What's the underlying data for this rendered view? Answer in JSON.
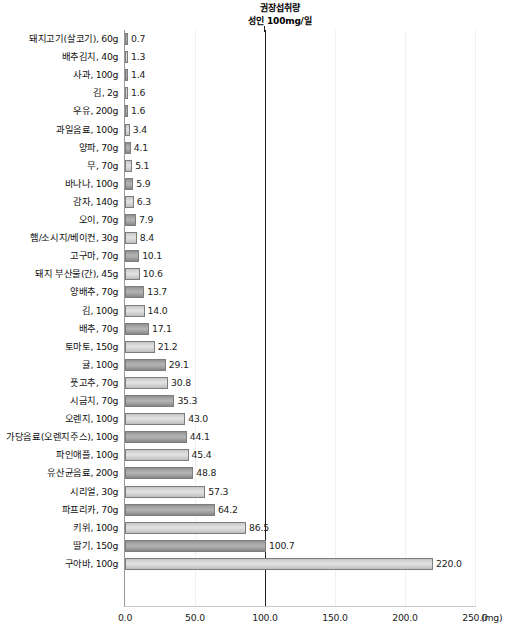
{
  "chart_data": {
    "type": "bar",
    "orientation": "horizontal",
    "title": "권장섭취량\n성인 100mg/일",
    "title_line1": "권장섭취량",
    "title_line2": "성인 100mg/일",
    "xlabel": "(mg)",
    "ylabel": "",
    "xlim": [
      0,
      250
    ],
    "xticks": [
      0.0,
      50.0,
      100.0,
      150.0,
      200.0,
      250.0
    ],
    "xtick_labels": [
      "0.0",
      "50.0",
      "100.0",
      "150.0",
      "200.0",
      "250.0"
    ],
    "grid": "vertical-light",
    "legend": "none",
    "reference_line": {
      "value": 100,
      "label": "권장섭취량 성인 100mg/일",
      "color": "#1e1e1e"
    },
    "categories": [
      "돼지고기(살코기), 60g",
      "배추김치, 40g",
      "사과, 100g",
      "김, 2g",
      "우유, 200g",
      "과일음료, 100g",
      "양파, 70g",
      "무, 70g",
      "바나나, 100g",
      "감자, 140g",
      "오이, 70g",
      "햄/소시지/베이컨, 30g",
      "고구마, 70g",
      "돼지 부산물(간), 45g",
      "양배추, 70g",
      "김, 100g",
      "배추, 70g",
      "토마토, 150g",
      "귤, 100g",
      "풋고추, 70g",
      "시금치, 70g",
      "오렌지, 100g",
      "가당음료(오렌지주스), 100g",
      "파인애플, 100g",
      "유산균음료, 200g",
      "시리얼, 30g",
      "파프리카, 70g",
      "키위, 100g",
      "딸기, 150g",
      "구아바, 100g"
    ],
    "values": [
      0.7,
      1.3,
      1.4,
      1.6,
      1.6,
      3.4,
      4.1,
      5.1,
      5.9,
      6.3,
      7.9,
      8.4,
      10.1,
      10.6,
      13.7,
      14.0,
      17.1,
      21.2,
      29.1,
      30.8,
      35.3,
      43.0,
      44.1,
      45.4,
      48.8,
      57.3,
      64.2,
      86.5,
      100.7,
      220.0
    ],
    "value_labels": [
      "0.7",
      "1.3",
      "1.4",
      "1.6",
      "1.6",
      "3.4",
      "4.1",
      "5.1",
      "5.9",
      "6.3",
      "7.9",
      "8.4",
      "10.1",
      "10.6",
      "13.7",
      "14.0",
      "17.1",
      "21.2",
      "29.1",
      "30.8",
      "35.3",
      "43.0",
      "44.1",
      "45.4",
      "48.8",
      "57.3",
      "64.2",
      "86.5",
      "100.7",
      "220.0"
    ],
    "bar_shades": [
      "dark",
      "light",
      "dark",
      "light",
      "dark",
      "light",
      "dark",
      "light",
      "dark",
      "light",
      "dark",
      "light",
      "dark",
      "light",
      "dark",
      "light",
      "dark",
      "light",
      "dark",
      "light",
      "dark",
      "light",
      "dark",
      "light",
      "dark",
      "light",
      "dark",
      "light",
      "dark",
      "light"
    ],
    "colors": {
      "bar_dark": "#a8a8a8",
      "bar_light": "#d8d8d8",
      "bar_border": "#7d7d7d",
      "reference_line": "#1e1e1e",
      "gridline": "#f0f0f0",
      "axis": "#9a9a9a"
    }
  }
}
